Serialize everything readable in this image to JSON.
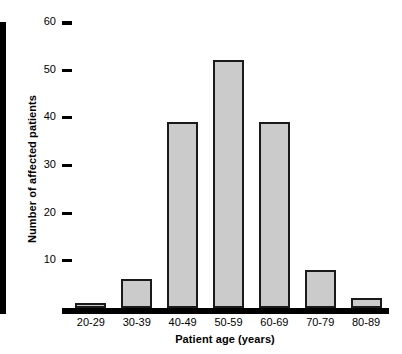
{
  "chart_data": {
    "type": "bar",
    "title": "",
    "xlabel": "Patient age (years)",
    "ylabel": "Number of affected patients",
    "categories": [
      "20-29",
      "30-39",
      "40-49",
      "50-59",
      "60-69",
      "70-79",
      "80-89"
    ],
    "values": [
      1,
      6,
      39,
      52,
      39,
      8,
      2
    ],
    "ylim": [
      0,
      60
    ],
    "yticks": [
      10,
      20,
      30,
      40,
      50,
      60
    ],
    "ytick_labels": [
      "10",
      "20",
      "30",
      "40",
      "50",
      "60"
    ],
    "grid": false,
    "legend": null,
    "bar_fill_color": "#cbcbcb",
    "bar_edge_color": "#1a1a1a",
    "axis_color": "#000000"
  }
}
